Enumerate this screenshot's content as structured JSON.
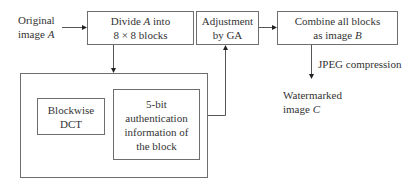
{
  "diagram": {
    "input": {
      "line1": "Original",
      "line2_prefix": "image ",
      "line2_var": "A"
    },
    "divide": {
      "line1_prefix": "Divide ",
      "line1_var": "A",
      "line1_suffix": " into",
      "line2": "8 × 8 blocks"
    },
    "adjust": {
      "line1": "Adjustment",
      "line2": "by GA"
    },
    "combine": {
      "line1": "Combine all blocks",
      "line2_prefix": "as image ",
      "line2_var": "B"
    },
    "compression_label": "JPEG compression",
    "output": {
      "line1": "Watermarked",
      "line2_prefix": "image ",
      "line2_var": "C"
    },
    "group": {
      "dct": {
        "line1": "Blockwise",
        "line2": "DCT"
      },
      "auth": {
        "line1": "5-bit",
        "line2": "authentication",
        "line3": "information of",
        "line4": "the block"
      }
    }
  }
}
